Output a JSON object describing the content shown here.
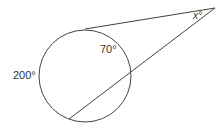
{
  "diagram": {
    "type": "circle-tangent-secant",
    "labels": {
      "arc_near": "70°",
      "arc_far": "200°",
      "angle": "x°"
    },
    "colors": {
      "stroke": "#444444",
      "text": "#333333",
      "background": "#ffffff"
    }
  }
}
